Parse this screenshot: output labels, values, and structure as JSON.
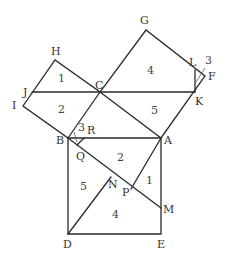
{
  "diagram": {
    "type": "pythagorean-dissection",
    "points": {
      "A": "A",
      "B": "B",
      "C": "C",
      "D": "D",
      "E": "E",
      "F": "F",
      "G": "G",
      "H": "H",
      "I": "I",
      "J": "J",
      "K": "K",
      "L": "L",
      "M": "M",
      "N": "N",
      "P": "P",
      "Q": "Q",
      "R": "R"
    },
    "regions": {
      "r1_top": "1",
      "r2_left": "2",
      "r4_top": "4",
      "r5_right": "5",
      "r3_top": "3",
      "r3_bottom": "3",
      "r2_bottom": "2",
      "r1_bottom": "1",
      "r5_bottom": "5",
      "r4_bottom": "4"
    }
  }
}
